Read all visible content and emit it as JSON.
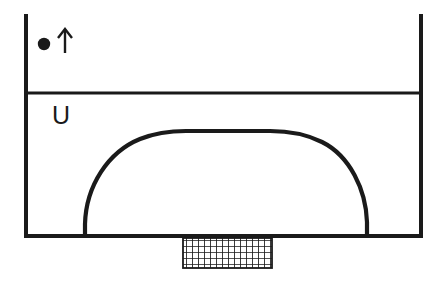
{
  "diagram": {
    "background_color": "#ffffff",
    "stroke_color": "#1a1a1a",
    "labels": {
      "region_label": "U",
      "particle_marker": "●",
      "direction_arrow": "↑"
    },
    "annotations": [
      {
        "name": "particle-dot",
        "symbol": "●",
        "meaning": "point-mass",
        "x": 44,
        "y": 44
      },
      {
        "name": "up-arrow",
        "symbol": "↑",
        "meaning": "upward-direction",
        "x": 64,
        "y": 42
      },
      {
        "name": "u-label",
        "symbol": "U",
        "meaning": "potential-region-U",
        "x": 58,
        "y": 122
      }
    ],
    "geometry": {
      "outer_frame": {
        "left": 24,
        "right": 422,
        "top": 14,
        "bottom": 237,
        "stroke_width": 4
      },
      "divider_line": {
        "y": 93,
        "x_start": 24,
        "x_end": 422,
        "stroke_width": 3
      },
      "dome": {
        "left_foot_x": 85,
        "right_foot_x": 368,
        "base_y": 237,
        "apex_y": 131,
        "flat_top_start_x": 186,
        "flat_top_end_x": 270,
        "stroke_width": 4
      },
      "hatched_support": {
        "left": 183,
        "right": 272,
        "top": 238,
        "bottom": 268,
        "cell_size": 6,
        "stroke_width": 1.6
      }
    }
  }
}
